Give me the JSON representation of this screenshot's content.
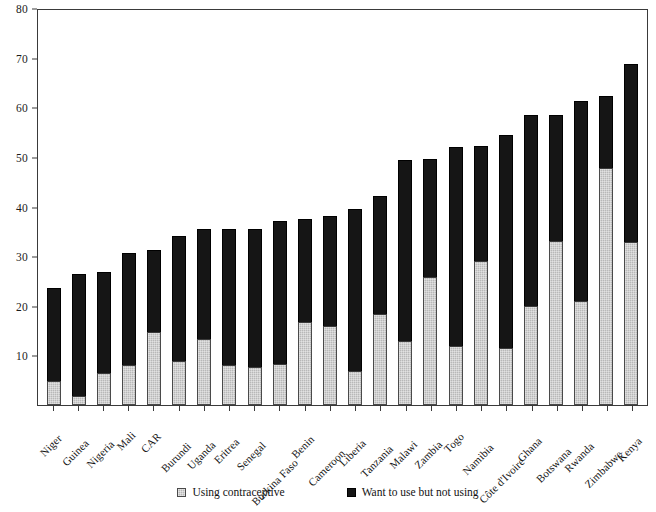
{
  "chart_data": {
    "type": "bar",
    "subtype": "stacked",
    "title": "",
    "xlabel": "",
    "ylabel": "",
    "ylim": [
      0,
      80
    ],
    "yticks": [
      0,
      10,
      20,
      30,
      40,
      50,
      60,
      70,
      80
    ],
    "ytick_labels": [
      "",
      "10",
      "20",
      "30",
      "40",
      "50",
      "60",
      "70",
      "80"
    ],
    "grid": false,
    "legend_position": "bottom-center",
    "categories": [
      "Niger",
      "Guinea",
      "Nigeria",
      "Mali",
      "CAR",
      "Burundi",
      "Uganda",
      "Eritrea",
      "Senegal",
      "Burkina Faso",
      "Benin",
      "Cameroon",
      "Liberia",
      "Tanzania",
      "Malawi",
      "Zambia",
      "Togo",
      "Namibia",
      "Côte d'Ivoire",
      "Ghana",
      "Botswana",
      "Rwanda",
      "Zimbabwe",
      "Kenya"
    ],
    "series": [
      {
        "name": "Using contraceptive",
        "color": "#b8b8b8",
        "values": [
          4.8,
          1.9,
          6.4,
          8.1,
          14.8,
          8.9,
          13.4,
          8.0,
          7.7,
          8.3,
          16.8,
          16.0,
          6.9,
          18.4,
          13.0,
          25.7,
          11.9,
          29.0,
          11.4,
          20.0,
          33.0,
          21.0,
          47.8,
          32.8
        ]
      },
      {
        "name": "Want to use but not using",
        "color": "#151515",
        "values": [
          18.8,
          24.6,
          20.4,
          22.6,
          16.4,
          25.1,
          22.0,
          27.5,
          27.8,
          28.8,
          20.6,
          22.0,
          32.5,
          23.8,
          36.4,
          23.8,
          40.1,
          23.2,
          43.0,
          38.4,
          25.5,
          40.2,
          14.4,
          35.9
        ]
      }
    ],
    "totals": [
      23.6,
      26.5,
      26.8,
      30.7,
      31.2,
      34.0,
      35.4,
      35.5,
      35.5,
      37.1,
      37.4,
      38.0,
      39.4,
      42.2,
      49.4,
      49.5,
      52.0,
      52.2,
      54.4,
      58.4,
      58.5,
      61.2,
      62.2,
      68.7
    ],
    "legend": [
      {
        "label": "Using contraceptive",
        "swatch": "gray-swatch-icon",
        "color": "#b8b8b8"
      },
      {
        "label": "Want to use but not using",
        "swatch": "black-swatch-icon",
        "color": "#151515"
      }
    ],
    "axis_color": "#3a3a3a"
  }
}
